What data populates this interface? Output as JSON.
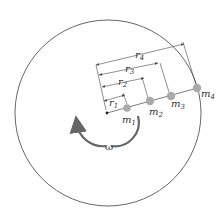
{
  "diagram": {
    "type": "rotating disk with point masses",
    "disk": {
      "cx": 108,
      "cy": 113,
      "r": 93,
      "stroke": "#555555"
    },
    "center": {
      "x": 107,
      "y": 113
    },
    "angular_velocity_label": "ω",
    "masses": [
      {
        "label": "m",
        "sub": "1",
        "x": 127,
        "y": 108,
        "r": 3.5
      },
      {
        "label": "m",
        "sub": "2",
        "x": 150,
        "y": 101,
        "r": 4
      },
      {
        "label": "m",
        "sub": "3",
        "x": 171,
        "y": 96,
        "r": 4
      },
      {
        "label": "m",
        "sub": "4",
        "x": 197,
        "y": 88,
        "r": 4
      }
    ],
    "radii": [
      {
        "label": "r",
        "sub": "1"
      },
      {
        "label": "r",
        "sub": "2"
      },
      {
        "label": "r",
        "sub": "3"
      },
      {
        "label": "r",
        "sub": "4"
      }
    ],
    "mass_color": "#aaaaaa",
    "line_color": "#444444"
  }
}
